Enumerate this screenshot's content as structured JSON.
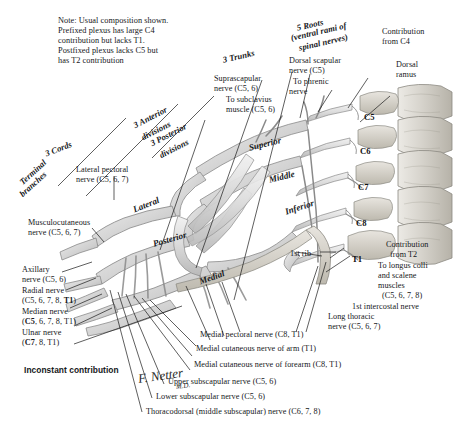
{
  "figure": {
    "artist_signature": "F. Netter",
    "signature_suffix": "M.D."
  },
  "note": {
    "lines": [
      "Note: Usual composition shown.",
      "Prefixed plexus has large C4",
      "contribution but lacks T1.",
      "Postfixed plexus lacks C5 but",
      "has T2 contribution"
    ]
  },
  "section_headers": {
    "terminal_branches": "Terminal\nbranches",
    "cords": "3 Cords",
    "divisions": "3 Anterior\ndivisions\n3 Posterior\ndivisions",
    "trunks": "3 Trunks",
    "roots": "5 Roots\n(ventral rami of\nspinal nerves)"
  },
  "structure_labels": {
    "trunk_superior": "Superior",
    "trunk_middle": "Middle",
    "trunk_inferior": "Inferior",
    "cord_lateral": "Lateral",
    "cord_posterior": "Posterior",
    "cord_medial": "Medial"
  },
  "vertebrae": [
    {
      "label": "C5"
    },
    {
      "label": "C6"
    },
    {
      "label": "C7"
    },
    {
      "label": "C8"
    },
    {
      "label": "T1"
    }
  ],
  "labels_top": {
    "suprascapular": "Suprascapular\nnerve (C5, 6)",
    "subclavius": "To subclavius\nmuscle (C5, 6)",
    "dorsal_scapular": "Dorsal scapular\nnerve (C5)",
    "phrenic": "To phrenic\nnerve",
    "contribution_c4": "Contribution\nfrom C4",
    "dorsal_ramus": "Dorsal\nramus"
  },
  "labels_left": {
    "lateral_pectoral": "Lateral pectoral\nnerve (C5, 6, 7)",
    "musculocutaneous": "Musculocutaneous\nnerve (C5, 6, 7)",
    "axillary": "Axillary\nnerve (C5, 6)",
    "radial_1": "Radial nerve",
    "radial_2": "(C5, 6, 7, 8, ",
    "radial_bold": "T1",
    "radial_3": ")",
    "median_1": "Median nerve",
    "median_bold": "C5",
    "median_2": "(",
    "median_3": ", 6, 7, 8, T1)",
    "ulnar_1": "Ulnar nerve",
    "ulnar_bold": "C7",
    "ulnar_2": "(",
    "ulnar_3": ", 8, T1)",
    "inconstant": "Inconstant contribution"
  },
  "labels_right": {
    "contribution_t2": "Contribution\nfrom T2",
    "longus_colli": "To longus colli\nand scalene\nmuscles\n(C5, 6, 7, 8)",
    "first_intercostal": "1st intercostal nerve",
    "long_thoracic": "Long thoracic\nnerve (C5, 6, 7)",
    "first_rib": "1st rib"
  },
  "labels_bottom": [
    {
      "text": "Medial pectoral nerve (C8, T1)"
    },
    {
      "text": "Medial cutaneous nerve of arm (T1)"
    },
    {
      "text": "Medial cutaneous nerve of forearm (C8, T1)"
    },
    {
      "text": "Upper subscapular nerve (C5, 6)"
    },
    {
      "text": "Lower subscapular nerve (C5, 6)"
    },
    {
      "text": "Thoracodorsal (middle subscapular) nerve (C6, 7, 8)"
    }
  ],
  "colors": {
    "nerve_fill": "#d9d9d9",
    "nerve_light": "#eeeeee",
    "nerve_outline": "#8a8a8a",
    "bone_fill": "#d4d2cd",
    "bone_outline": "#8b8982",
    "leader_line": "#1a1a1a",
    "text": "#15171a",
    "background": "#ffffff"
  }
}
